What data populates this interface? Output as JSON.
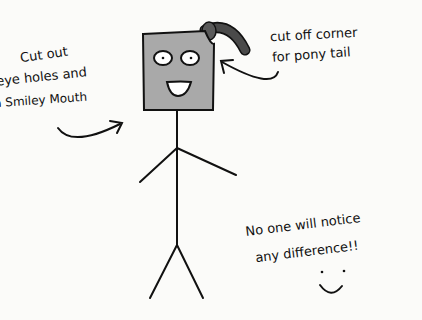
{
  "annotations": {
    "left": {
      "line1": "Cut out",
      "line2": "eye holes and",
      "line3": "a Smiley Mouth"
    },
    "right": {
      "line1": "cut off corner",
      "line2": "for pony tail"
    },
    "bottom": {
      "line1": "No one will notice",
      "line2": "any difference!!"
    }
  },
  "colors": {
    "head_fill": "#a9a9a9",
    "ponytail": "#4a4a4a",
    "ink": "#111111",
    "background": "#fbfbf9"
  }
}
